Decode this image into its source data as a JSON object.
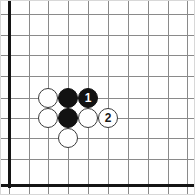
{
  "figure": {
    "kind": "go-board-diagram",
    "width": 195,
    "height": 195,
    "background_color": "#ffffff",
    "border_color": "#d8d8d8"
  },
  "board": {
    "line_color": "#8a8a8a",
    "edge_color": "#141414",
    "edge_thickness": 3,
    "cell_size": 20,
    "top_edge_visible": false,
    "right_edge_visible": false,
    "left_edge_visible": true,
    "bottom_edge_visible": true,
    "vertical_lines_x": [
      8,
      28,
      47,
      67,
      87,
      107,
      127,
      147,
      167,
      186
    ],
    "horizontal_lines_y": [
      13,
      34,
      54,
      75,
      97,
      117,
      137,
      158,
      184
    ]
  },
  "stones": {
    "diameter": 20,
    "black_color": "#121212",
    "white_color": "#ffffff",
    "white_outline_color": "#3a3a3a",
    "items": [
      {
        "color": "white",
        "label": "",
        "x": 47,
        "y": 97,
        "name": "stone-white-c3r5"
      },
      {
        "color": "black",
        "label": "",
        "x": 67,
        "y": 97,
        "name": "stone-black-c4r5"
      },
      {
        "color": "black",
        "label": "1",
        "x": 87,
        "y": 97,
        "name": "stone-black-move-1"
      },
      {
        "color": "white",
        "label": "",
        "x": 47,
        "y": 117,
        "name": "stone-white-c3r6"
      },
      {
        "color": "black",
        "label": "",
        "x": 67,
        "y": 117,
        "name": "stone-black-c4r6"
      },
      {
        "color": "white",
        "label": "",
        "x": 87,
        "y": 117,
        "name": "stone-white-c5r6"
      },
      {
        "color": "white",
        "label": "2",
        "x": 107,
        "y": 117,
        "name": "stone-white-move-2"
      },
      {
        "color": "white",
        "label": "",
        "x": 67,
        "y": 137,
        "name": "stone-white-c4r7"
      }
    ]
  }
}
